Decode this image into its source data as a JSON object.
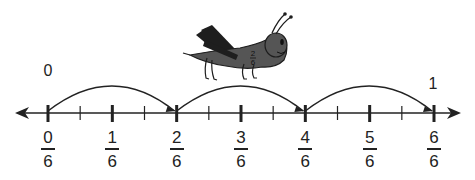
{
  "diagram": {
    "type": "number-line",
    "range": [
      0,
      1
    ],
    "denominator": 6,
    "end_labels": {
      "start": "0",
      "end": "1"
    },
    "tick_labels": [
      {
        "numerator": "0",
        "denominator": "6",
        "value": 0
      },
      {
        "numerator": "1",
        "denominator": "6",
        "value": 0.1667
      },
      {
        "numerator": "2",
        "denominator": "6",
        "value": 0.3333
      },
      {
        "numerator": "3",
        "denominator": "6",
        "value": 0.5
      },
      {
        "numerator": "4",
        "denominator": "6",
        "value": 0.6667
      },
      {
        "numerator": "5",
        "denominator": "6",
        "value": 0.8333
      },
      {
        "numerator": "6",
        "denominator": "6",
        "value": 1
      }
    ],
    "minor_ticks_between_majors": 1,
    "jumps": [
      {
        "from": "0/6",
        "to": "2/6"
      },
      {
        "from": "2/6",
        "to": "4/6"
      },
      {
        "from": "4/6",
        "to": "6/6"
      }
    ],
    "grasshopper": {
      "body_label": "2/6",
      "body_label_numerator": "2",
      "body_label_denominator": "6"
    },
    "colors": {
      "line": "#222222",
      "grasshopper": "#555555",
      "grasshopper_dark": "#1e1e1e"
    }
  }
}
